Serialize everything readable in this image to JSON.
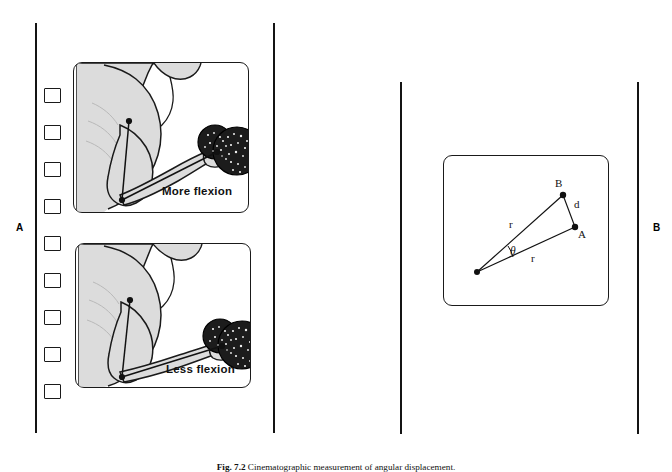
{
  "figure": {
    "caption_prefix": "Fig. 7.2",
    "caption_text": "Cinematographic measurement of angular displacement.",
    "background_color": "#ffffff",
    "ink_color": "#141414",
    "body_fill_color": "#dcdcdc",
    "weight_fill_color": "#1c1c1c"
  },
  "panels": [
    {
      "id": "A",
      "label": "A",
      "description": "Film strip with two cine frames of a forearm curl holding a dumbbell",
      "perforation_count": 9,
      "frames": [
        {
          "label": "More flexion",
          "order": 1
        },
        {
          "label": "Less flexion",
          "order": 2
        }
      ]
    },
    {
      "id": "B",
      "label": "B",
      "description": "Geometric construction of angular displacement between positions A and B",
      "vertices": [
        {
          "name": "pivot",
          "label": ""
        },
        {
          "name": "B",
          "label": "B"
        },
        {
          "name": "A",
          "label": "A"
        }
      ],
      "segments": [
        {
          "name": "radius-to-B",
          "label": "r"
        },
        {
          "name": "radius-to-A",
          "label": "r"
        },
        {
          "name": "chord-A-B",
          "label": "d"
        }
      ],
      "angle": {
        "name": "theta",
        "label": "θ"
      }
    }
  ]
}
